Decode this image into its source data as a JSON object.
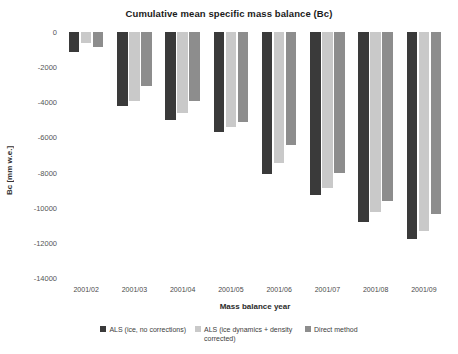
{
  "chart_data": {
    "type": "bar",
    "title": "Cumulative mean specific mass balance (Bc)",
    "xlabel": "Mass balance year",
    "ylabel": "Bc [mm w.e.]",
    "categories": [
      "2001/02",
      "2001/03",
      "2001/04",
      "2001/05",
      "2001/06",
      "2001/07",
      "2001/08",
      "2001/09"
    ],
    "series": [
      {
        "name": "ALS (ice, no corrections)",
        "color": "#3a3a3a",
        "values": [
          -1150,
          -4200,
          -5000,
          -5700,
          -8100,
          -9300,
          -10800,
          -11800
        ]
      },
      {
        "name": "ALS (ice dynamics + density corrected)",
        "color": "#c9c9c9",
        "values": [
          -600,
          -3900,
          -4600,
          -5400,
          -7450,
          -8900,
          -10250,
          -11300
        ]
      },
      {
        "name": "Direct method",
        "color": "#8d8d8d",
        "values": [
          -850,
          -3050,
          -3900,
          -5100,
          -6450,
          -8050,
          -9600,
          -10350
        ]
      }
    ],
    "ylim": [
      -14000,
      0
    ],
    "yticks": [
      0,
      -2000,
      -4000,
      -6000,
      -8000,
      -10000,
      -12000,
      -14000
    ],
    "ytick_labels": [
      "0",
      "-2000",
      "-4000",
      "-6000",
      "-8000",
      "-10000",
      "-12000",
      "-14000"
    ],
    "grid": false,
    "legend_position": "bottom"
  }
}
